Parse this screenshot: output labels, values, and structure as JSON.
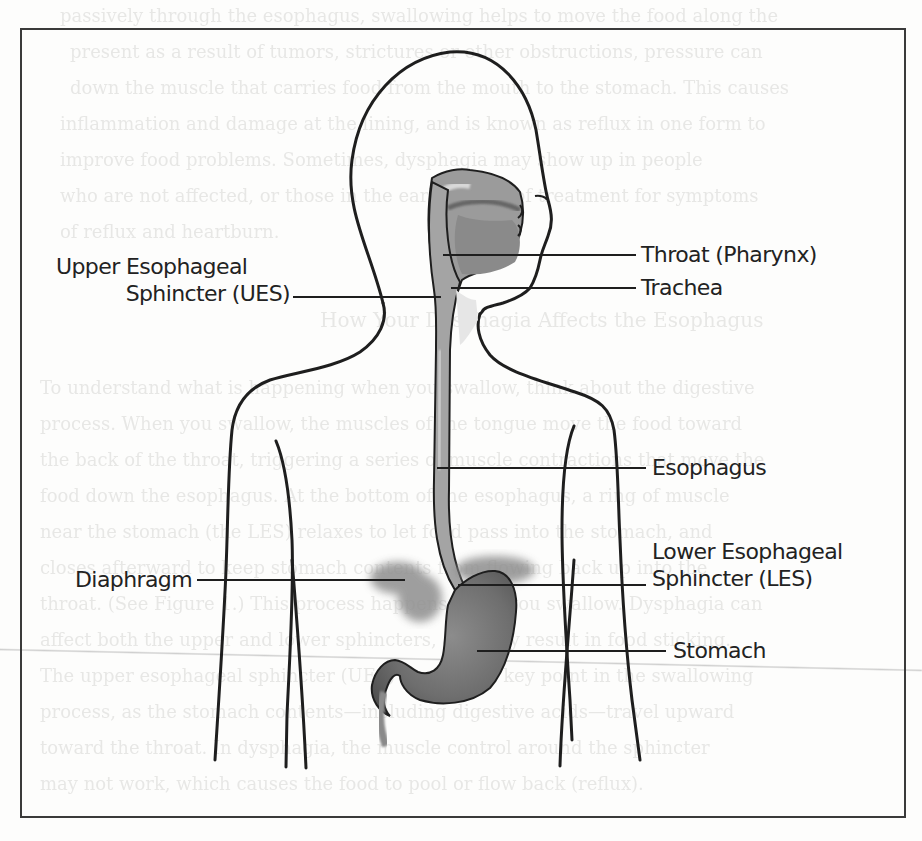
{
  "figure": {
    "labels": {
      "upper_esophageal_sphincter_line1": "Upper Esophageal",
      "upper_esophageal_sphincter_line2": "Sphincter (UES)",
      "throat": "Throat (Pharynx)",
      "trachea": "Trachea",
      "esophagus": "Esophagus",
      "lower_esophageal_sphincter_line1": "Lower Esophageal",
      "lower_esophageal_sphincter_line2": "Sphincter (LES)",
      "diaphragm": "Diaphragm",
      "stomach": "Stomach"
    },
    "colors": {
      "outline": "#222222",
      "organ_fill": "#7a7a7a",
      "organ_light": "#b8b8b8",
      "diaphragm_fill": "#9a9a9a",
      "frame": "#3a3a3a"
    }
  },
  "background_bleed_text": {
    "heading": "How Your Dysphagia Affects the Esophagus",
    "lines": [
      "passively through the esophagus, swallowing helps to move the food along the",
      "present as a result of tumors, strictures or other obstructions, pressure can",
      "down the muscle that carries food from the mouth to the stomach. This causes",
      "inflammation and damage at the lining, and is known as reflux in one form to",
      "improve food problems. Sometimes, dysphagia may show up in people",
      "who are not affected, or those in the early stages of treatment for symptoms",
      "of reflux and heartburn."
    ],
    "lines_lower": [
      "To understand what is happening when you swallow, think about the digestive",
      "process. When you swallow, the muscles of the tongue move the food toward",
      "the back of the throat, triggering a series of muscle contractions that move the",
      "food down the esophagus. At the bottom of the esophagus, a ring of muscle",
      "near the stomach (the LES) relaxes to let food pass into the stomach, and",
      "closes afterward to keep stomach contents from flowing back up into the",
      "throat. (See Figure 1.) This process happens when you swallow. Dysphagia can",
      "affect both the upper and lower sphincters, and may result in food sticking.",
      "The upper esophageal sphincter (UES) becomes a key point in the swallowing",
      "process, as the stomach contents—including digestive acids—travel upward",
      "toward the throat. In dysphagia, the muscle control around the sphincter",
      "may not work, which causes the food to pool or flow back (reflux)."
    ]
  }
}
